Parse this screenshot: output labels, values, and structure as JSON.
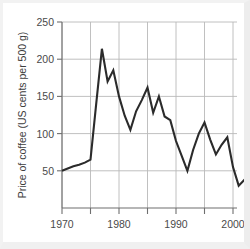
{
  "chart_data": {
    "type": "line",
    "title": "",
    "subtitle": "",
    "xlabel": "",
    "ylabel": "Price of coffee (US cents per 500 g)",
    "xlim": [
      1969,
      2006
    ],
    "ylim": [
      0,
      250
    ],
    "grid": true,
    "legend": false,
    "legend_position": "none",
    "y_ticks": [
      50,
      100,
      150,
      200,
      250
    ],
    "y_tick_labels": [
      "50",
      "100",
      "150",
      "200",
      "250"
    ],
    "x_ticks": [
      1970,
      1975,
      1980,
      1985,
      1990,
      1995,
      2000,
      2005
    ],
    "x_tick_labels": [
      "1970",
      "",
      "1980",
      "",
      "1990",
      "",
      "2000",
      ""
    ],
    "x_labeled_ticks": [
      {
        "year": 1970,
        "label": "1970"
      },
      {
        "year": 1980,
        "label": "1980"
      },
      {
        "year": 1990,
        "label": "1990"
      },
      {
        "year": 2000,
        "label": "2000"
      }
    ],
    "series": [
      {
        "name": "Price of coffee",
        "color": "#2b2b2b",
        "x": [
          1970,
          1971,
          1972,
          1973,
          1974,
          1975,
          1976,
          1977,
          1978,
          1979,
          1980,
          1981,
          1982,
          1983,
          1984,
          1985,
          1986,
          1987,
          1988,
          1989,
          1990,
          1991,
          1992,
          1993,
          1994,
          1995,
          1996,
          1997,
          1998,
          1999,
          2000,
          2001,
          2002,
          2003,
          2004,
          2005
        ],
        "values": [
          50,
          53,
          56,
          58,
          61,
          65,
          140,
          214,
          170,
          185,
          150,
          124,
          105,
          130,
          145,
          162,
          128,
          150,
          123,
          118,
          90,
          70,
          50,
          78,
          100,
          115,
          92,
          72,
          85,
          95,
          55,
          30,
          38,
          23,
          33,
          47
        ]
      }
    ]
  }
}
